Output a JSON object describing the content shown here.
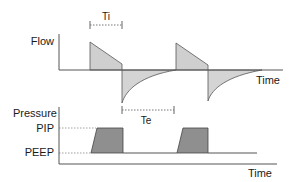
{
  "diagram": {
    "title": "",
    "flow_panel": {
      "y_label": "Flow",
      "x_label": "Time",
      "ti_label": "Ti",
      "te_label": "Te"
    },
    "pressure_panel": {
      "y_label": "Pressure",
      "pip_label": "PIP",
      "peep_label": "PEEP",
      "x_label": "Time"
    },
    "colors": {
      "axis": "#555555",
      "flow_fill": "#cfcfcf",
      "pressure_fill": "#8f8f8f",
      "dashed": "#777777"
    }
  }
}
